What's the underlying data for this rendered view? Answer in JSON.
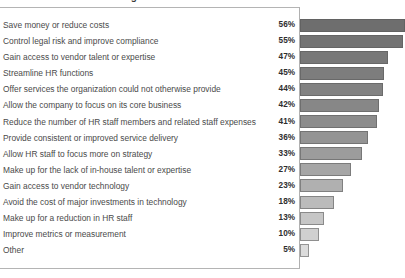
{
  "chart_data": {
    "type": "bar",
    "orientation": "horizontal",
    "title": "Reasons for HR Outsourcing",
    "xlabel": "",
    "ylabel": "",
    "xlim": [
      0,
      60
    ],
    "grid": false,
    "legend": false,
    "value_suffix": "%",
    "categories": [
      "Save money or reduce costs",
      "Control legal risk and improve compliance",
      "Gain access to vendor talent or expertise",
      "Streamline HR functions",
      "Offer services the organization could not otherwise provide",
      "Allow the company to focus on its core business",
      "Reduce the number of HR staff members and related staff expenses",
      "Provide consistent or improved service delivery",
      "Allow HR staff to focus more on strategy",
      "Make up for the lack of in-house talent or expertise",
      "Gain access to vendor technology",
      "Avoid the cost of major investments in technology",
      "Make up for a reduction in HR staff",
      "Improve metrics or measurement",
      "Other"
    ],
    "values": [
      56,
      55,
      47,
      45,
      44,
      42,
      41,
      36,
      33,
      27,
      23,
      18,
      13,
      10,
      5
    ],
    "value_labels": [
      "56%",
      "55%",
      "47%",
      "45%",
      "44%",
      "42%",
      "41%",
      "36%",
      "33%",
      "27%",
      "23%",
      "18%",
      "13%",
      "10%",
      "5%"
    ],
    "bar_colors": [
      "#6e6e6e",
      "#737373",
      "#787878",
      "#7d7d7d",
      "#828282",
      "#878787",
      "#8c8c8c",
      "#949494",
      "#9c9c9c",
      "#a6a6a6",
      "#b0b0b0",
      "#bbbbbb",
      "#c6c6c6",
      "#d0d0d0",
      "#dcdcdc"
    ]
  },
  "colors": {
    "frame": "#b4b4b4",
    "label_text": "#4a4a4a",
    "value_text": "#2e2e2e",
    "background": "#ffffff"
  }
}
